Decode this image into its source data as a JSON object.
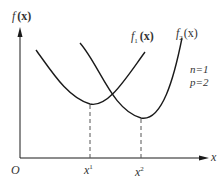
{
  "diagram": {
    "y_axis_label_f": "f",
    "y_axis_label_arg": "(x)",
    "x_axis_label": "x",
    "origin_label": "O",
    "curves": [
      {
        "name": "f1",
        "label_f": "f",
        "label_sub": "1",
        "label_arg": "(x)"
      },
      {
        "name": "f2",
        "label_f": "f",
        "label_sub": "2",
        "label_arg": "(x)"
      }
    ],
    "minima": [
      {
        "label": "x",
        "sup": "1"
      },
      {
        "label": "x",
        "sup": "2"
      }
    ],
    "params": {
      "n": "n=1",
      "p": "p=2"
    },
    "colors": {
      "line": "#1a1a1a",
      "text": "#333333",
      "dash": "#555555"
    }
  }
}
